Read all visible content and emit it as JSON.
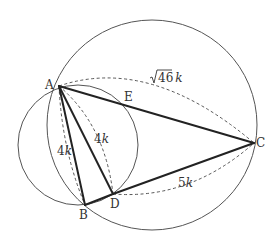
{
  "diagram": {
    "points": {
      "A": {
        "label": "A",
        "x": 59,
        "y": 86
      },
      "B": {
        "label": "B",
        "x": 85,
        "y": 205
      },
      "C": {
        "label": "C",
        "x": 254,
        "y": 143
      },
      "D": {
        "label": "D",
        "x": 113,
        "y": 194
      },
      "E": {
        "label": "E",
        "x": 127,
        "y": 104
      }
    },
    "circles": [
      {
        "name": "circumcircle-ABC",
        "cx": 152,
        "cy": 125,
        "r": 105
      },
      {
        "name": "circle-ABDE",
        "cx": 78,
        "cy": 145,
        "r": 60
      }
    ],
    "segments": [
      "AB",
      "AD",
      "AC",
      "BD",
      "DC"
    ],
    "measurements": {
      "AB": {
        "text_num": "4",
        "text_var": "k"
      },
      "AD": {
        "text_num": "4",
        "text_var": "k"
      },
      "DC": {
        "text_num": "5",
        "text_var": "k"
      },
      "AC": {
        "text_sqrt": "46",
        "text_var": "k"
      }
    }
  }
}
